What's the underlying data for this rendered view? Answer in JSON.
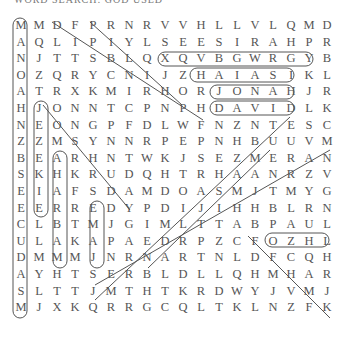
{
  "title": "WORD SEARCH: GOD USED",
  "grid": [
    [
      "M",
      "M",
      "D",
      "F",
      "P",
      "R",
      "N",
      "R",
      "V",
      "V",
      "H",
      "L",
      "L",
      "V",
      "L",
      "Q",
      "M",
      "D"
    ],
    [
      "A",
      "Q",
      "L",
      "I",
      "P",
      "I",
      "Y",
      "L",
      "S",
      "E",
      "E",
      "S",
      "I",
      "R",
      "A",
      "H",
      "P",
      "R"
    ],
    [
      "N",
      "J",
      "T",
      "T",
      "S",
      "B",
      "L",
      "Q",
      "X",
      "Q",
      "V",
      "B",
      "G",
      "W",
      "R",
      "G",
      "Y",
      "B"
    ],
    [
      "O",
      "Z",
      "Q",
      "R",
      "Y",
      "C",
      "N",
      "I",
      "J",
      "Z",
      "H",
      "A",
      "I",
      "A",
      "S",
      "I",
      "K",
      "L"
    ],
    [
      "A",
      "T",
      "R",
      "X",
      "K",
      "M",
      "I",
      "R",
      "H",
      "O",
      "R",
      "J",
      "O",
      "N",
      "A",
      "H",
      "J",
      "R"
    ],
    [
      "H",
      "J",
      "O",
      "N",
      "N",
      "T",
      "C",
      "P",
      "N",
      "P",
      "H",
      "D",
      "A",
      "V",
      "I",
      "D",
      "L",
      "K"
    ],
    [
      "N",
      "E",
      "O",
      "N",
      "G",
      "P",
      "F",
      "D",
      "L",
      "W",
      "F",
      "N",
      "Z",
      "N",
      "T",
      "E",
      "S",
      "C"
    ],
    [
      "Z",
      "Z",
      "M",
      "S",
      "Y",
      "N",
      "N",
      "R",
      "P",
      "E",
      "P",
      "N",
      "H",
      "B",
      "U",
      "U",
      "V",
      "M"
    ],
    [
      "B",
      "E",
      "A",
      "R",
      "H",
      "N",
      "T",
      "W",
      "K",
      "J",
      "S",
      "E",
      "Z",
      "M",
      "E",
      "R",
      "A",
      "N"
    ],
    [
      "S",
      "K",
      "H",
      "K",
      "R",
      "U",
      "D",
      "Q",
      "H",
      "T",
      "R",
      "H",
      "A",
      "A",
      "N",
      "R",
      "Z",
      "V"
    ],
    [
      "E",
      "I",
      "A",
      "F",
      "S",
      "D",
      "A",
      "M",
      "D",
      "O",
      "A",
      "S",
      "M",
      "J",
      "T",
      "M",
      "Y",
      "G"
    ],
    [
      "E",
      "E",
      "R",
      "R",
      "E",
      "D",
      "Y",
      "P",
      "D",
      "I",
      "J",
      "I",
      "H",
      "H",
      "B",
      "L",
      "R",
      "N"
    ],
    [
      "C",
      "L",
      "B",
      "T",
      "M",
      "J",
      "G",
      "I",
      "M",
      "L",
      "T",
      "T",
      "A",
      "B",
      "P",
      "A",
      "U",
      "L"
    ],
    [
      "U",
      "L",
      "A",
      "K",
      "A",
      "P",
      "A",
      "E",
      "D",
      "R",
      "P",
      "Z",
      "C",
      "F",
      "O",
      "Z",
      "H",
      "L"
    ],
    [
      "D",
      "M",
      "M",
      "M",
      "J",
      "N",
      "R",
      "N",
      "A",
      "R",
      "T",
      "N",
      "L",
      "D",
      "F",
      "C",
      "Q",
      "H"
    ],
    [
      "A",
      "Y",
      "H",
      "T",
      "S",
      "E",
      "R",
      "B",
      "L",
      "D",
      "L",
      "L",
      "Q",
      "H",
      "M",
      "H",
      "A",
      "R"
    ],
    [
      "S",
      "L",
      "T",
      "T",
      "J",
      "M",
      "T",
      "H",
      "T",
      "K",
      "R",
      "D",
      "W",
      "Y",
      "J",
      "V",
      "M",
      "J"
    ],
    [
      "M",
      "J",
      "X",
      "K",
      "Q",
      "R",
      "R",
      "G",
      "C",
      "Q",
      "L",
      "T",
      "K",
      "L",
      "N",
      "Z",
      "F",
      "K"
    ]
  ],
  "found_words": [
    "MANOAH",
    "DANIEL",
    "PHILIP",
    "PHARISEES",
    "ISAIAH",
    "JONAH",
    "DAVID",
    "EZEKIEL",
    "MAHALABJ",
    "SEMAJ",
    "PAUL",
    "SAMUEL",
    "JOHN",
    "JAMES",
    "BARNABAS"
  ]
}
